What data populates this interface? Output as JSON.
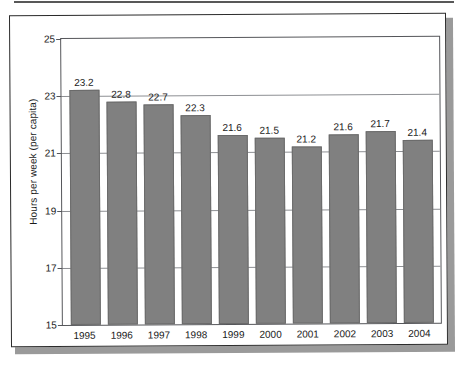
{
  "chart_data": {
    "type": "bar",
    "title": "",
    "xlabel": "",
    "ylabel": "Hours per week (per capita)",
    "categories": [
      "1995",
      "1996",
      "1997",
      "1998",
      "1999",
      "2000",
      "2001",
      "2002",
      "2003",
      "2004"
    ],
    "values": [
      23.2,
      22.8,
      22.7,
      22.3,
      21.6,
      21.5,
      21.2,
      21.6,
      21.7,
      21.4
    ],
    "value_labels": [
      "23.2",
      "22.8",
      "22.7",
      "22.3",
      "21.6",
      "21.5",
      "21.2",
      "21.6",
      "21.7",
      "21.4"
    ],
    "ylim": [
      15,
      25
    ],
    "yticks": [
      15,
      17,
      19,
      21,
      23,
      25
    ],
    "ytick_labels": [
      "15",
      "17",
      "19",
      "21",
      "23",
      "25"
    ],
    "grid": true,
    "legend": false,
    "bar_color": "#808080",
    "grid_color": "#8d8f93",
    "axis_color": "#55565a",
    "text_color": "#1a1a1a"
  }
}
